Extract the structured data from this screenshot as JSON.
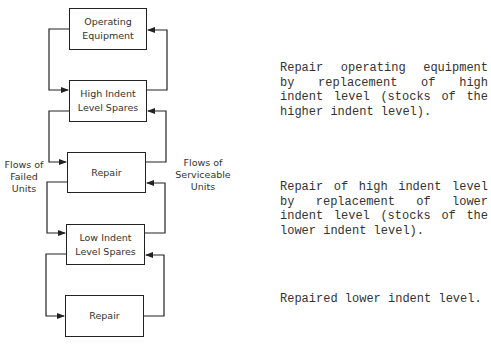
{
  "diagram": {
    "boxes": [
      {
        "id": "operating-equipment",
        "label": "Operating Equipment"
      },
      {
        "id": "high-indent-spares",
        "label": "High Indent Level Spares"
      },
      {
        "id": "repair-1",
        "label": "Repair"
      },
      {
        "id": "low-indent-spares",
        "label": "Low Indent Level Spares"
      },
      {
        "id": "repair-2",
        "label": "Repair"
      }
    ],
    "flow_labels": {
      "left": "Flows of Failed Units",
      "right": "Flows of Serviceable Units"
    },
    "descriptions": [
      "Repair operating equipment by replacement of high indent level (stocks of the higher indent level).",
      "Repair of high indent level by replacement of lower indent level (stocks of the lower indent level).",
      "Repaired lower indent level."
    ],
    "colors": {
      "line": "#222222",
      "text": "#333333",
      "background": "#ffffff"
    }
  }
}
